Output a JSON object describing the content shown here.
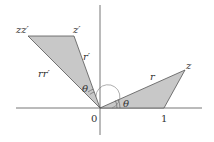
{
  "diagram": {
    "type": "complex-multiplication-similar-triangles",
    "colors": {
      "fill": "#c8c8c8",
      "stroke": "#555555",
      "axis": "#666666",
      "text": "#333333"
    },
    "axes": {
      "origin_label": "0",
      "unit_label": "1"
    },
    "triangle_1": {
      "vertices": [
        "0",
        "1",
        "z"
      ],
      "vertex_label": "z",
      "side_label": "r",
      "angle_label": "θ"
    },
    "triangle_2": {
      "vertices": [
        "0",
        "z′",
        "zz′"
      ],
      "vertex_label_1": "z′",
      "vertex_label_2": "zz′",
      "side_label_1": "r′",
      "side_label_2": "rr′",
      "angle_label": "θ"
    }
  }
}
